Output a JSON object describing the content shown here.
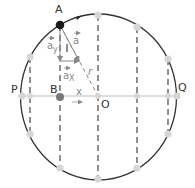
{
  "diagram": {
    "labels": {
      "A": "A",
      "B": "B",
      "O": "O",
      "P": "P",
      "Q": "Q",
      "a": "a",
      "a_y": "a",
      "a_y_sub": "y",
      "a_x": "a",
      "a_x_sub": "X",
      "r": "r",
      "x": "x"
    },
    "colors": {
      "circle": "#333333",
      "dashed": "#555555",
      "axis": "#bbbbbb",
      "point_A": "#1a1a1a",
      "point_B": "#7a7a7a",
      "points_light": "#d6d6d6",
      "vector": "#888888",
      "label": "#333333"
    },
    "center": [
      98,
      96
    ],
    "radius_x": 78,
    "radius_y": 83,
    "points": [
      {
        "name": "A",
        "x": 60,
        "y": 25,
        "style": "dark"
      },
      {
        "name": "top",
        "x": 98,
        "y": 15,
        "style": "light"
      },
      {
        "name": "upper-right",
        "x": 137,
        "y": 27,
        "style": "light"
      },
      {
        "name": "upper-left",
        "x": 30,
        "y": 57,
        "style": "light"
      },
      {
        "name": "right-upper",
        "x": 168,
        "y": 59,
        "style": "light"
      },
      {
        "name": "P",
        "x": 22,
        "y": 96,
        "style": "light"
      },
      {
        "name": "Q",
        "x": 177,
        "y": 96,
        "style": "light"
      },
      {
        "name": "lower-left",
        "x": 30,
        "y": 134,
        "style": "light"
      },
      {
        "name": "right-lower",
        "x": 168,
        "y": 134,
        "style": "light"
      },
      {
        "name": "bottom-left",
        "x": 60,
        "y": 168,
        "style": "light"
      },
      {
        "name": "bottom",
        "x": 98,
        "y": 179,
        "style": "light"
      },
      {
        "name": "bottom-right",
        "x": 137,
        "y": 168,
        "style": "light"
      },
      {
        "name": "B",
        "x": 60,
        "y": 97,
        "style": "medium"
      }
    ]
  }
}
